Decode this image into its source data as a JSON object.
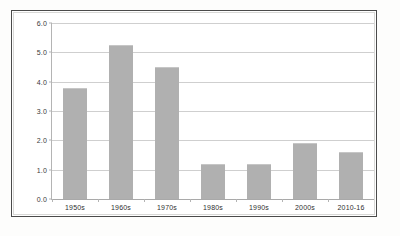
{
  "chart_data": {
    "type": "bar",
    "title": "",
    "subtitle": "",
    "xlabel": "",
    "ylabel": "",
    "categories": [
      "1950s",
      "1960s",
      "1970s",
      "1980s",
      "1990s",
      "2000s",
      "2010-16"
    ],
    "values": [
      3.8,
      5.25,
      4.5,
      1.2,
      1.2,
      1.9,
      1.6
    ],
    "series": [
      {
        "name": "",
        "values": [
          3.8,
          5.25,
          4.5,
          1.2,
          1.2,
          1.9,
          1.6
        ]
      }
    ],
    "ylim": [
      0.0,
      6.0
    ],
    "ytick_step": 1.0,
    "ytick_labels": [
      "0.0",
      "1.0",
      "2.0",
      "3.0",
      "4.0",
      "5.0",
      "6.0"
    ],
    "ytick_values": [
      0.0,
      1.0,
      2.0,
      3.0,
      4.0,
      5.0,
      6.0
    ],
    "grid": true,
    "grid_axis": "y",
    "legend": false,
    "legend_position": "none",
    "annotations": [],
    "colors": {
      "bar_fill": "#b0b0b0",
      "gridline": "#cfcfcf",
      "axis_line": "#b4b4b4",
      "tick_label": "#3a3a3a",
      "frame_border": "#4a4a4a",
      "plot_background": "#ffffff",
      "page_background": "#fdfdfc"
    }
  }
}
